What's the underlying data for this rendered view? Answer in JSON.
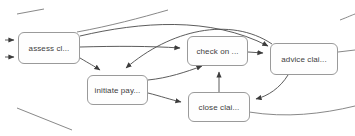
{
  "diagram": {
    "type": "process-graph",
    "title": "",
    "background_color": "#ffffff",
    "node_fill": "#fefefe",
    "node_border_color": "#9a9a9a",
    "edge_color": "#4a4a4a",
    "label_color": "#404040",
    "nodes": [
      {
        "id": "assess",
        "label": "assess cl...",
        "x": 18,
        "y": 32,
        "w": 62,
        "h": 32
      },
      {
        "id": "initiate",
        "label": "initiate pay...",
        "x": 87,
        "y": 75,
        "w": 61,
        "h": 30
      },
      {
        "id": "check",
        "label": "check on ...",
        "x": 187,
        "y": 36,
        "w": 61,
        "h": 30
      },
      {
        "id": "advice",
        "label": "advice clai...",
        "x": 270,
        "y": 43,
        "w": 68,
        "h": 32
      },
      {
        "id": "close",
        "label": "close clai...",
        "x": 188,
        "y": 92,
        "w": 62,
        "h": 30
      }
    ],
    "edges": [
      {
        "from": "assess",
        "to": "initiate"
      },
      {
        "from": "assess",
        "to": "check"
      },
      {
        "from": "assess",
        "to": "advice"
      },
      {
        "from": "initiate",
        "to": "check"
      },
      {
        "from": "initiate",
        "to": "close"
      },
      {
        "from": "close",
        "to": "check"
      },
      {
        "from": "check",
        "to": "advice"
      },
      {
        "from": "advice",
        "to": "close"
      },
      {
        "from": "advice",
        "to": "initiate"
      }
    ],
    "clipped_background_curves": 6
  }
}
